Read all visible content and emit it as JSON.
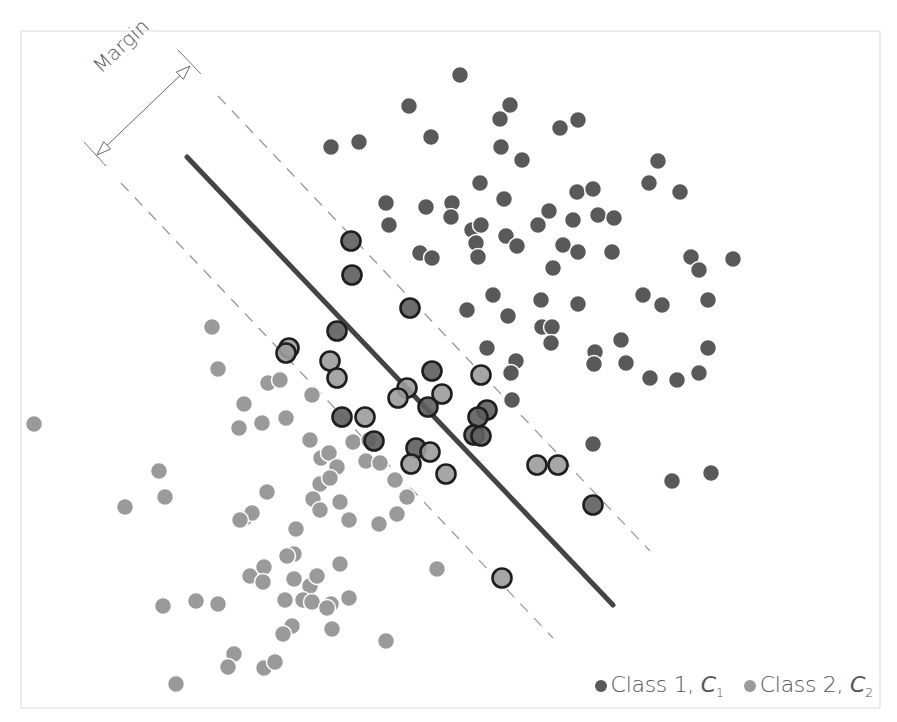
{
  "chart_data": {
    "type": "scatter",
    "title": "",
    "subtitle": "",
    "xlabel": "",
    "ylabel": "",
    "grid": false,
    "axes_visible": false,
    "legend_position": "bottom-right",
    "annotations": [
      {
        "text": "Margin",
        "kind": "double-arrow",
        "from": [
          97,
          155
        ],
        "to": [
          190,
          66
        ]
      }
    ],
    "decision_boundary": {
      "x1": 187,
      "y1": 157,
      "x2": 613,
      "y2": 605,
      "color": "#444444",
      "width": 5
    },
    "margin_lines": [
      {
        "x1": 218,
        "y1": 96,
        "x2": 650,
        "y2": 551
      },
      {
        "x1": 121,
        "y1": 183,
        "x2": 553,
        "y2": 638
      }
    ],
    "series": [
      {
        "name": "Class 1, C1",
        "color": "#595959",
        "points": [
          [
            460,
            75
          ],
          [
            409,
            106
          ],
          [
            510,
            105
          ],
          [
            500,
            119
          ],
          [
            431,
            137
          ],
          [
            331,
            147
          ],
          [
            359,
            142
          ],
          [
            501,
            147
          ],
          [
            522,
            160
          ],
          [
            560,
            128
          ],
          [
            578,
            120
          ],
          [
            658,
            161
          ],
          [
            649,
            183
          ],
          [
            680,
            192
          ],
          [
            480,
            183
          ],
          [
            577,
            192
          ],
          [
            593,
            189
          ],
          [
            504,
            199
          ],
          [
            386,
            203
          ],
          [
            426,
            207
          ],
          [
            452,
            203
          ],
          [
            549,
            211
          ],
          [
            573,
            220
          ],
          [
            598,
            215
          ],
          [
            614,
            218
          ],
          [
            389,
            225
          ],
          [
            451,
            217
          ],
          [
            472,
            230
          ],
          [
            481,
            225
          ],
          [
            476,
            243
          ],
          [
            506,
            236
          ],
          [
            517,
            246
          ],
          [
            538,
            225
          ],
          [
            563,
            245
          ],
          [
            578,
            252
          ],
          [
            612,
            252
          ],
          [
            420,
            253
          ],
          [
            432,
            258
          ],
          [
            478,
            257
          ],
          [
            553,
            268
          ],
          [
            691,
            257
          ],
          [
            699,
            270
          ],
          [
            733,
            259
          ],
          [
            493,
            295
          ],
          [
            541,
            300
          ],
          [
            578,
            304
          ],
          [
            643,
            295
          ],
          [
            662,
            305
          ],
          [
            708,
            300
          ],
          [
            467,
            310
          ],
          [
            508,
            316
          ],
          [
            542,
            327
          ],
          [
            552,
            327
          ],
          [
            551,
            343
          ],
          [
            487,
            348
          ],
          [
            516,
            361
          ],
          [
            595,
            352
          ],
          [
            594,
            364
          ],
          [
            621,
            340
          ],
          [
            626,
            363
          ],
          [
            650,
            378
          ],
          [
            677,
            380
          ],
          [
            699,
            373
          ],
          [
            708,
            348
          ],
          [
            511,
            373
          ],
          [
            512,
            400
          ],
          [
            593,
            444
          ],
          [
            672,
            481
          ],
          [
            711,
            473
          ]
        ]
      },
      {
        "name": "Class 2, C2",
        "color": "#9a9a9a",
        "points": [
          [
            34,
            424
          ],
          [
            212,
            327
          ],
          [
            218,
            369
          ],
          [
            268,
            383
          ],
          [
            280,
            380
          ],
          [
            244,
            404
          ],
          [
            312,
            395
          ],
          [
            239,
            428
          ],
          [
            262,
            423
          ],
          [
            286,
            418
          ],
          [
            310,
            440
          ],
          [
            159,
            471
          ],
          [
            165,
            497
          ],
          [
            125,
            507
          ],
          [
            267,
            492
          ],
          [
            245,
            518
          ],
          [
            252,
            513
          ],
          [
            240,
            520
          ],
          [
            296,
            529
          ],
          [
            294,
            554
          ],
          [
            321,
            458
          ],
          [
            329,
            453
          ],
          [
            337,
            467
          ],
          [
            320,
            484
          ],
          [
            330,
            478
          ],
          [
            313,
            499
          ],
          [
            320,
            510
          ],
          [
            340,
            502
          ],
          [
            349,
            520
          ],
          [
            353,
            442
          ],
          [
            366,
            461
          ],
          [
            380,
            463
          ],
          [
            369,
            440
          ],
          [
            395,
            480
          ],
          [
            407,
            497
          ],
          [
            379,
            524
          ],
          [
            397,
            514
          ],
          [
            250,
            576
          ],
          [
            264,
            567
          ],
          [
            263,
            582
          ],
          [
            287,
            556
          ],
          [
            294,
            579
          ],
          [
            285,
            600
          ],
          [
            310,
            586
          ],
          [
            317,
            576
          ],
          [
            340,
            564
          ],
          [
            303,
            600
          ],
          [
            331,
            604
          ],
          [
            349,
            598
          ],
          [
            312,
            602
          ],
          [
            327,
            608
          ],
          [
            163,
            606
          ],
          [
            196,
            601
          ],
          [
            218,
            604
          ],
          [
            234,
            654
          ],
          [
            228,
            667
          ],
          [
            264,
            668
          ],
          [
            275,
            662
          ],
          [
            292,
            626
          ],
          [
            283,
            634
          ],
          [
            332,
            629
          ],
          [
            386,
            641
          ],
          [
            176,
            684
          ],
          [
            437,
            569
          ]
        ]
      },
      {
        "name": "Support vectors (outlined)",
        "points": [
          {
            "x": 351,
            "y": 241,
            "class": 1
          },
          {
            "x": 352,
            "y": 275,
            "class": 1
          },
          {
            "x": 410,
            "y": 308,
            "class": 1
          },
          {
            "x": 337,
            "y": 331,
            "class": 1
          },
          {
            "x": 289,
            "y": 348,
            "class": 2
          },
          {
            "x": 286,
            "y": 353,
            "class": 2
          },
          {
            "x": 330,
            "y": 361,
            "class": 2
          },
          {
            "x": 337,
            "y": 378,
            "class": 2
          },
          {
            "x": 432,
            "y": 371,
            "class": 1
          },
          {
            "x": 407,
            "y": 388,
            "class": 2
          },
          {
            "x": 398,
            "y": 398,
            "class": 2
          },
          {
            "x": 442,
            "y": 394,
            "class": 2
          },
          {
            "x": 428,
            "y": 407,
            "class": 1
          },
          {
            "x": 481,
            "y": 375,
            "class": 2
          },
          {
            "x": 342,
            "y": 417,
            "class": 1
          },
          {
            "x": 365,
            "y": 417,
            "class": 2
          },
          {
            "x": 487,
            "y": 410,
            "class": 1
          },
          {
            "x": 478,
            "y": 417,
            "class": 1
          },
          {
            "x": 374,
            "y": 441,
            "class": 1
          },
          {
            "x": 474,
            "y": 435,
            "class": 1
          },
          {
            "x": 481,
            "y": 436,
            "class": 1
          },
          {
            "x": 416,
            "y": 448,
            "class": 1
          },
          {
            "x": 430,
            "y": 452,
            "class": 2
          },
          {
            "x": 411,
            "y": 464,
            "class": 2
          },
          {
            "x": 446,
            "y": 474,
            "class": 2
          },
          {
            "x": 537,
            "y": 465,
            "class": 2
          },
          {
            "x": 558,
            "y": 465,
            "class": 2
          },
          {
            "x": 593,
            "y": 505,
            "class": 1
          },
          {
            "x": 502,
            "y": 578,
            "class": 2
          }
        ]
      }
    ],
    "legend": [
      {
        "label_prefix": "Class 1, ",
        "symbol": "C",
        "subscript": "1",
        "color": "#595959"
      },
      {
        "label_prefix": "Class 2, ",
        "symbol": "C",
        "subscript": "2",
        "color": "#9a9a9a"
      }
    ]
  },
  "annotation": {
    "margin_label": "Margin"
  },
  "legend": {
    "class1": {
      "prefix": "Class 1, ",
      "symbol": "C",
      "sub": "1"
    },
    "class2": {
      "prefix": "Class 2, ",
      "symbol": "C",
      "sub": "2"
    }
  }
}
